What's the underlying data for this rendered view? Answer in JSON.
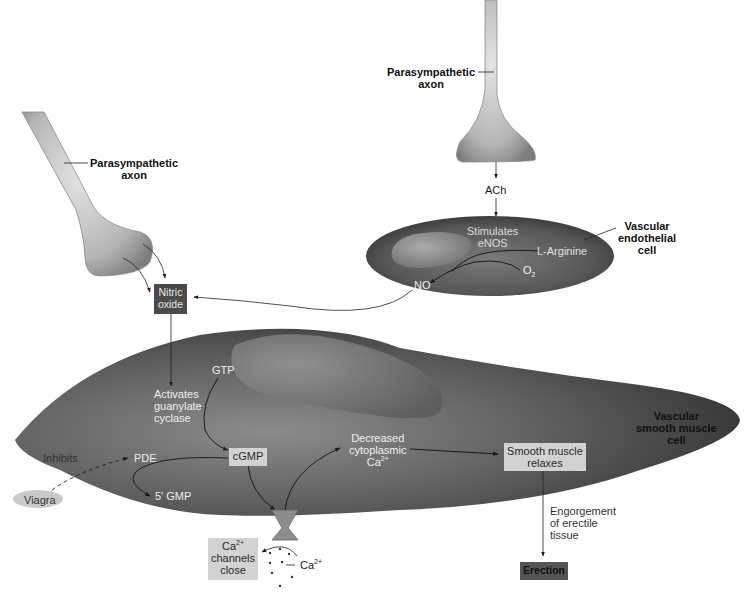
{
  "diagram": {
    "axon_left": {
      "label_line1": "Parasympathetic",
      "label_line2": "axon"
    },
    "axon_right": {
      "label_line1": "Parasympathetic",
      "label_line2": "axon"
    },
    "ach": "ACh",
    "endothelial_cell": {
      "label_line1": "Vascular",
      "label_line2": "endothelial",
      "label_line3": "cell",
      "stimulates_line1": "Stimulates",
      "stimulates_line2": "eNOS",
      "l_arginine": "L-Arginine",
      "o2_base": "O",
      "o2_sub": "2",
      "no": "NO"
    },
    "nitric_oxide_box": {
      "line1": "Nitric",
      "line2": "oxide"
    },
    "smooth_muscle_cell": {
      "label_line1": "Vascular",
      "label_line2": "smooth muscle",
      "label_line3": "cell",
      "gtp": "GTP",
      "activates_line1": "Activates",
      "activates_line2": "guanylate",
      "activates_line3": "cyclase",
      "cgmp": "cGMP",
      "pde": "PDE",
      "five_gmp": "5′ GMP",
      "inhibits": "Inhibits",
      "decreased_line1": "Decreased",
      "decreased_line2": "cytoplasmic",
      "decreased_ca_base": "Ca",
      "decreased_ca_sup": "2+",
      "relaxes_line1": "Smooth muscle",
      "relaxes_line2": "relaxes"
    },
    "viagra": "Viagra",
    "ca_channels_box": {
      "ca_base": "Ca",
      "ca_sup": "2+",
      "line2": "channels",
      "line3": "close"
    },
    "ca_outside": {
      "base": "Ca",
      "sup": "2+"
    },
    "engorgement_line1": "Engorgement",
    "engorgement_line2": "of erectile",
    "engorgement_line3": "tissue",
    "erection": "Erection"
  },
  "colors": {
    "cell_dark": "#3a3a3a",
    "cell_mid": "#6e6e6e",
    "cell_light": "#a8a8a8",
    "axon_light": "#d9d9d9",
    "axon_dark": "#8f8f8f",
    "box_dark": "#4a4a4a",
    "box_light": "#d2d2d2"
  }
}
